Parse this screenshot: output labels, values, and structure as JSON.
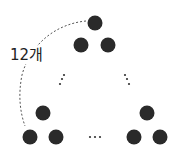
{
  "diagram": {
    "type": "triangular-arrangement-of-circles",
    "label": "12개",
    "colors": {
      "circle": "#2a2a2a",
      "dash": "#555555",
      "background": "#ffffff"
    },
    "circles": [
      {
        "cx": 95,
        "cy": 23,
        "r": 7.5
      },
      {
        "cx": 81,
        "cy": 45,
        "r": 7.5
      },
      {
        "cx": 108,
        "cy": 45,
        "r": 7.5
      },
      {
        "cx": 43,
        "cy": 113,
        "r": 7.5
      },
      {
        "cx": 30,
        "cy": 137,
        "r": 7.5
      },
      {
        "cx": 56,
        "cy": 137,
        "r": 7.5
      },
      {
        "cx": 147,
        "cy": 113,
        "r": 7.5
      },
      {
        "cx": 134,
        "cy": 137,
        "r": 7.5
      },
      {
        "cx": 160,
        "cy": 137,
        "r": 7.5
      }
    ],
    "ellipsis_marks": {
      "left_diagonal": [
        [
          64,
          75
        ],
        [
          62,
          79
        ],
        [
          60,
          84
        ]
      ],
      "right_diagonal": [
        [
          125,
          75
        ],
        [
          127,
          79
        ],
        [
          129,
          84
        ]
      ],
      "bottom_horizontal": [
        [
          90,
          137
        ],
        [
          95,
          137
        ],
        [
          100,
          137
        ]
      ]
    },
    "brace_arc_path": "M 86 21 C 55 24, 30 45, 22 75 C 18 95, 20 112, 25 126"
  }
}
